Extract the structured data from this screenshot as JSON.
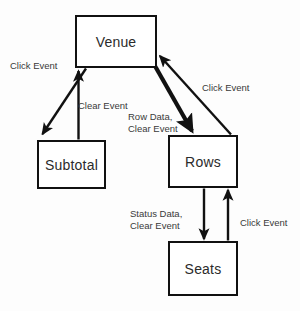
{
  "diagram": {
    "type": "state-flow-diagram",
    "background_color": "#fdfdfd",
    "stroke_color": "#111111",
    "text_color": "#3a3a3a",
    "nodes": [
      {
        "id": "venue",
        "label": "Venue",
        "x": 75,
        "y": 15,
        "w": 82,
        "h": 53
      },
      {
        "id": "subtotal",
        "label": "Subtotal",
        "x": 37,
        "y": 140,
        "w": 69,
        "h": 49
      },
      {
        "id": "rows",
        "label": "Rows",
        "x": 168,
        "y": 135,
        "w": 70,
        "h": 53
      },
      {
        "id": "seats",
        "label": "Seats",
        "x": 168,
        "y": 241,
        "w": 70,
        "h": 55
      }
    ],
    "edges": [
      {
        "id": "venue-to-subtotal",
        "from": "venue",
        "to": "subtotal",
        "label_lines": [
          "Click Event"
        ],
        "label_x": 10,
        "label_y": 60
      },
      {
        "id": "subtotal-to-venue",
        "from": "subtotal",
        "to": "venue",
        "label_lines": [
          "Clear Event"
        ],
        "label_x": 78,
        "label_y": 100
      },
      {
        "id": "venue-to-rows",
        "from": "venue",
        "to": "rows",
        "label_lines": [
          "Row Data,",
          "Clear Event"
        ],
        "label_x": 128,
        "label_y": 111
      },
      {
        "id": "rows-to-venue",
        "from": "rows",
        "to": "venue",
        "label_lines": [
          "Click Event"
        ],
        "label_x": 202,
        "label_y": 82
      },
      {
        "id": "rows-to-seats",
        "from": "rows",
        "to": "seats",
        "label_lines": [
          "Status Data,",
          "Clear Event"
        ],
        "label_x": 130,
        "label_y": 208
      },
      {
        "id": "seats-to-rows",
        "from": "seats",
        "to": "rows",
        "label_lines": [
          "Click Event"
        ],
        "label_x": 240,
        "label_y": 217
      }
    ]
  }
}
